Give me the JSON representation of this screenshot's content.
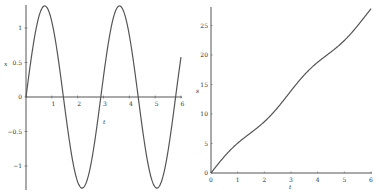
{
  "chart_data": [
    {
      "type": "line",
      "title": "",
      "xlabel": "t",
      "ylabel": "x",
      "xlim": [
        0,
        6
      ],
      "ylim": [
        -1.32,
        1.32
      ],
      "xticks": [
        "1",
        "2",
        "3",
        "4",
        "5",
        "6"
      ],
      "yticks": [
        "-1",
        "-0.5",
        "0",
        "0.5",
        "1"
      ],
      "grid": false,
      "series": [
        {
          "name": "x(t)",
          "function": "1.32*sin(2.17*t)",
          "x": [
            0,
            0.5,
            1,
            1.5,
            2,
            2.5,
            3,
            3.5,
            4,
            4.5,
            5,
            5.5,
            6
          ],
          "values": [
            0,
            1.17,
            1.09,
            -0.14,
            -1.23,
            -1.0,
            0.28,
            1.29,
            0.9,
            -0.42,
            -1.31,
            -0.79,
            0.55
          ]
        }
      ],
      "color": "#555555"
    },
    {
      "type": "line",
      "title": "",
      "xlabel": "t",
      "ylabel": "s",
      "xlim": [
        0,
        6
      ],
      "ylim": [
        0,
        28
      ],
      "xticks": [
        "0",
        "1",
        "2",
        "3",
        "4",
        "5",
        "6"
      ],
      "yticks": [
        "0",
        "5",
        "10",
        "15",
        "20",
        "25"
      ],
      "grid": false,
      "series": [
        {
          "name": "s(t)",
          "function": "4.6*t + 0.6*(1-cos(2.17*t))/2.17*... (approx)",
          "x": [
            0,
            0.5,
            1,
            1.5,
            2,
            2.5,
            3,
            3.5,
            4,
            4.5,
            5,
            5.5,
            6
          ],
          "values": [
            0,
            2.5,
            4.5,
            7.3,
            9.3,
            11.3,
            14.3,
            16.3,
            18.3,
            21.0,
            23.0,
            25.3,
            27.7
          ]
        }
      ],
      "color": "#555555"
    }
  ]
}
